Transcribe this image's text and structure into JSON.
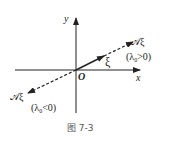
{
  "figure": {
    "caption": "图 7-3",
    "axes": {
      "x_label": "x",
      "y_label": "y",
      "origin_label": "O"
    },
    "vector": {
      "label": "ξ"
    },
    "positive_case": {
      "image_label": "𝒜ξ",
      "condition_pre": "(λ",
      "condition_sub": "0",
      "condition_post": ">0)"
    },
    "negative_case": {
      "image_label": "𝒜ξ",
      "condition_pre": "(λ",
      "condition_sub": "0",
      "condition_post": "<0)"
    },
    "colors": {
      "ink": "#222222",
      "caption": "#555555",
      "background": "#ffffff"
    }
  }
}
